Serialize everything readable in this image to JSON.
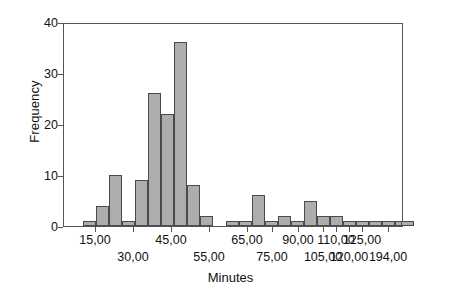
{
  "chart_data": {
    "type": "bar",
    "title": "",
    "subtitle": "",
    "xlabel": "Minutes",
    "ylabel": "Frequency",
    "ylim": [
      0,
      40
    ],
    "yticks": [
      0,
      10,
      20,
      30,
      40
    ],
    "ytick_labels": [
      "0",
      "10",
      "20",
      "30",
      "40"
    ],
    "grid": false,
    "legend": null,
    "bar_color": "#adadad",
    "bar_edge_color": "#4a4a4a",
    "axis_color": "#555555",
    "xtick_labels": [
      "15,00",
      "30,00",
      "45,00",
      "55,00",
      "65,00",
      "75,00",
      "90,00",
      "105,00",
      "110,00",
      "120,00",
      "125,00",
      "194,00"
    ],
    "xtick_label_rows": [
      1,
      2,
      1,
      2,
      1,
      2,
      1,
      2,
      1,
      2,
      1,
      2
    ],
    "xtick_positions_px": [
      95,
      133,
      171,
      209,
      247,
      272,
      298,
      323,
      336,
      349,
      362,
      388
    ],
    "categories": [
      "b1",
      "b2",
      "b3",
      "b4",
      "b5",
      "b6",
      "b7",
      "b8",
      "b9",
      "b10",
      "b11",
      "b12",
      "b13",
      "b14",
      "b15",
      "b16",
      "b17",
      "b18",
      "b19",
      "b20",
      "b21",
      "b22",
      "b23",
      "b24",
      "b25",
      "b26"
    ],
    "values": [
      1,
      4,
      10,
      1,
      9,
      26,
      22,
      36,
      8,
      2,
      0,
      1,
      1,
      6,
      1,
      2,
      1,
      5,
      2,
      2,
      1,
      1,
      1,
      1,
      1,
      1
    ],
    "bar_left_px": [
      82,
      95,
      108,
      121,
      134,
      147,
      160,
      173,
      186,
      199,
      212,
      225,
      238,
      251,
      264,
      277,
      290,
      303,
      316,
      329,
      342,
      355,
      368,
      381,
      394,
      400
    ],
    "bar_width_px": [
      13,
      13,
      13,
      13,
      13,
      13,
      13,
      13,
      13,
      13,
      13,
      13,
      13,
      13,
      13,
      13,
      13,
      13,
      13,
      13,
      13,
      13,
      13,
      13,
      13,
      13
    ]
  }
}
